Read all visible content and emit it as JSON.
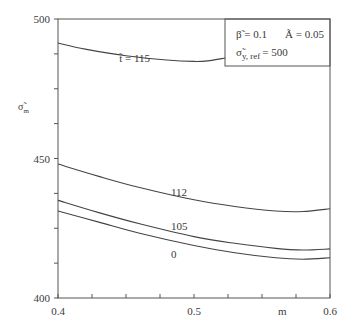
{
  "chart_data": {
    "type": "line",
    "title": "",
    "xlabel": "m",
    "ylabel": "σ̃_m",
    "xlim": [
      0.4,
      0.6
    ],
    "ylim": [
      400,
      500
    ],
    "x_ticks": [
      "0.4",
      "0.5",
      "0.6"
    ],
    "y_ticks": [
      "400",
      "450",
      "500"
    ],
    "x_minor_step": 0.025,
    "y_minor_step": 12.5,
    "grid": false,
    "legend_box": {
      "line1_left": "β̃ = 0.1",
      "line1_right": "Ã = 0.05",
      "line2": "σ̃",
      "line2_sub": "y, ref",
      "line2_value": "= 500",
      "position": "top-right"
    },
    "series": [
      {
        "name": "t̃ = 115",
        "label": "t̃ = 115",
        "label_x": 0.445,
        "label_y": 484.5,
        "x": [
          0.4,
          0.42,
          0.45,
          0.48,
          0.5,
          0.51,
          0.523
        ],
        "y": [
          491.4,
          489.2,
          486.8,
          485.3,
          484.8,
          485.0,
          486.0
        ]
      },
      {
        "name": "112",
        "label": "112",
        "label_x": 0.483,
        "label_y": 436.5,
        "x": [
          0.4,
          0.43,
          0.46,
          0.5,
          0.53,
          0.56,
          0.58,
          0.6
        ],
        "y": [
          448.0,
          443.6,
          439.6,
          435.2,
          432.8,
          431.2,
          431.0,
          432.0
        ]
      },
      {
        "name": "105",
        "label": "105",
        "label_x": 0.483,
        "label_y": 424.5,
        "x": [
          0.4,
          0.43,
          0.46,
          0.5,
          0.53,
          0.56,
          0.58,
          0.6
        ],
        "y": [
          435.0,
          430.6,
          426.6,
          422.0,
          419.6,
          417.8,
          417.2,
          417.6
        ]
      },
      {
        "name": "0",
        "label": "0",
        "label_x": 0.483,
        "label_y": 414.3,
        "x": [
          0.4,
          0.43,
          0.46,
          0.5,
          0.53,
          0.56,
          0.58,
          0.6
        ],
        "y": [
          431.2,
          427.2,
          423.2,
          418.8,
          416.2,
          414.4,
          413.9,
          414.4
        ]
      }
    ]
  },
  "colors": {
    "axis": "#555555",
    "curve": "#444444",
    "text": "#3a3a3a",
    "background": "#ffffff"
  }
}
